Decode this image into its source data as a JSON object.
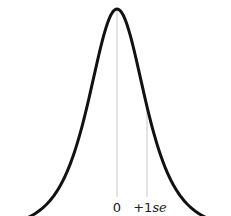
{
  "chart_data": {
    "type": "line",
    "title": "",
    "xlabel": "",
    "ylabel": "",
    "distribution": {
      "center": 0,
      "scale_se": 1
    },
    "x_range_se": [
      -3.4,
      3.4
    ],
    "markers": [
      {
        "x": 0,
        "label": "0"
      },
      {
        "x": 1,
        "label_prefix": "+1",
        "label_suffix": "se"
      }
    ],
    "grid": false,
    "legend": "none",
    "colors": {
      "curve": "#111111",
      "marker_line": "#c8c8c8",
      "label": "#222222"
    }
  }
}
